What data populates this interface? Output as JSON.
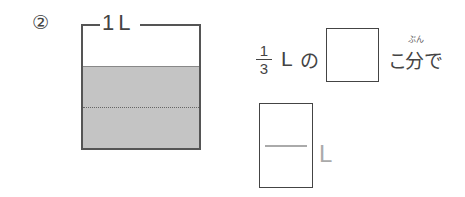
{
  "problem": {
    "number": "②",
    "container": {
      "capacity_label": "1L",
      "fill_fraction": "2/3",
      "divisions": 3
    },
    "sentence": {
      "fraction": {
        "numerator": "1",
        "denominator": "3"
      },
      "unit": "L",
      "particle": "の",
      "answer_box_1": "",
      "counter": "こ",
      "kanji": "分で",
      "ruby": "ぶん"
    },
    "answer_fraction_box": {
      "numerator": "",
      "denominator": "",
      "unit": "L"
    }
  },
  "colors": {
    "water": "#c4c4c4",
    "outline": "#555555",
    "answer_unit": "#aaaaaa"
  }
}
